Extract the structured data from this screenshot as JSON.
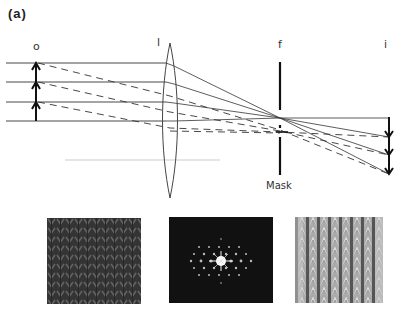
{
  "panel_label": "(a)",
  "labels": {
    "object": "o",
    "lens": "l",
    "focal_plane": "f",
    "image": "i",
    "mask": "Mask"
  },
  "optics": {
    "ray_y": [
      63,
      82,
      102,
      121
    ],
    "object_x": 36,
    "lens_x": 170,
    "lens_top": 43,
    "lens_bottom": 198,
    "mask_x": 280,
    "mask_top": 62,
    "mask_bottom": 175,
    "focal_point": [
      280,
      118
    ],
    "image_x": 389,
    "image_top": 117,
    "image_bottom": 175
  },
  "images": [
    {
      "name": "object-pattern",
      "description": "knitted fabric texture (object)"
    },
    {
      "name": "diffraction-pattern",
      "description": "Fourier transform / diffraction spots"
    },
    {
      "name": "filtered-image",
      "description": "filtered reconstructed image"
    }
  ]
}
